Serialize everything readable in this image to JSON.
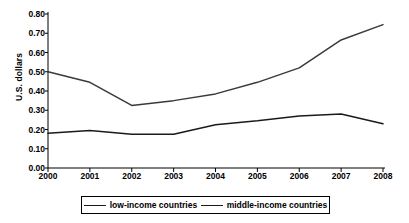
{
  "chart_data": {
    "type": "line",
    "title": "",
    "xlabel": "",
    "ylabel": "U.S. dollars",
    "categories": [
      "2000",
      "2001",
      "2002",
      "2003",
      "2004",
      "2005",
      "2006",
      "2007",
      "2008"
    ],
    "x": [
      2000,
      2001,
      2002,
      2003,
      2004,
      2005,
      2006,
      2007,
      2008
    ],
    "series": [
      {
        "name": "low-income countries",
        "color": "#1a1a1a",
        "values": [
          0.18,
          0.195,
          0.175,
          0.175,
          0.225,
          0.245,
          0.27,
          0.28,
          0.23
        ]
      },
      {
        "name": "middle-income countries",
        "color": "#3a3a3a",
        "values": [
          0.5,
          0.445,
          0.325,
          0.35,
          0.385,
          0.445,
          0.52,
          0.665,
          0.745
        ]
      }
    ],
    "ylim": [
      0.0,
      0.8
    ],
    "ytick_step": 0.1,
    "ytick_labels": [
      "0.00",
      "0.10",
      "0.20",
      "0.30",
      "0.40",
      "0.50",
      "0.60",
      "0.70",
      "0.80"
    ],
    "ytick_values": [
      0.0,
      0.1,
      0.2,
      0.3,
      0.4,
      0.5,
      0.6,
      0.7,
      0.8
    ],
    "grid": false,
    "legend_position": "bottom",
    "axis_color": "#000000"
  },
  "axes": {
    "y_title": "U.S. dollars"
  },
  "legend": {
    "entries": [
      {
        "label": "low-income countries"
      },
      {
        "label": "middle-income countries"
      }
    ]
  }
}
